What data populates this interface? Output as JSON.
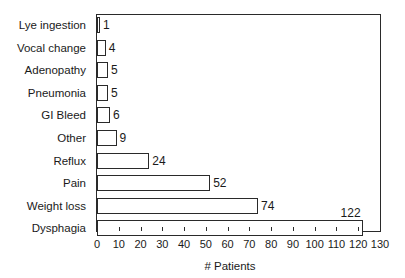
{
  "chart_data": {
    "type": "bar",
    "orientation": "horizontal",
    "title": "",
    "xlabel": "# Patients",
    "ylabel": "",
    "xlim": [
      0,
      130
    ],
    "grid": false,
    "legend": null,
    "categories": [
      "Lye ingestion",
      "Vocal change",
      "Adenopathy",
      "Pneumonia",
      "GI Bleed",
      "Other",
      "Reflux",
      "Pain",
      "Weight loss",
      "Dysphagia"
    ],
    "values": [
      1,
      4,
      5,
      5,
      6,
      9,
      24,
      52,
      74,
      122
    ],
    "x_ticks": [
      0,
      10,
      20,
      30,
      40,
      50,
      60,
      70,
      80,
      90,
      100,
      110,
      120,
      130
    ],
    "data_labels": [
      "1",
      "4",
      "5",
      "5",
      "6",
      "9",
      "24",
      "52",
      "74",
      "122"
    ]
  },
  "colors": {
    "bar_fill": "#ffffff",
    "bar_stroke": "#2a2a2a",
    "text": "#1a1a1a",
    "background": "#ffffff"
  }
}
